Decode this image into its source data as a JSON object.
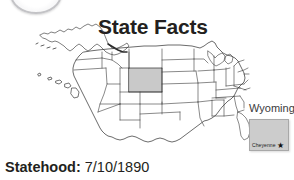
{
  "header": {
    "title": "State Facts",
    "badge_icon": "circle-emblem-icon"
  },
  "map": {
    "icon": "us-map-icon",
    "highlighted_state": "Wyoming",
    "highlight_color": "#c9c9c9",
    "outline_color": "#3a3a3a",
    "includes_alaska": "Alaska",
    "includes_hawaii": "Hawaii"
  },
  "callout": {
    "state_label": "Wyoming"
  },
  "inset": {
    "state_shape_color": "#cccccc",
    "capital_label": "Cheyenne",
    "capital_marker_icon": "star-icon",
    "capital_marker_glyph": "★"
  },
  "facts": {
    "statehood_label": "Statehood:",
    "statehood_value": "7/10/1890"
  }
}
